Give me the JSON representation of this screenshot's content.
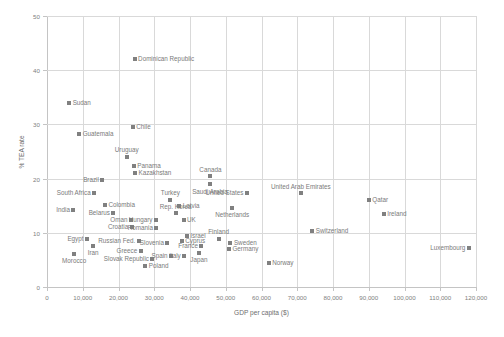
{
  "chart_data": {
    "type": "scatter",
    "title": "",
    "xlabel": "GDP per capita ($)",
    "ylabel": "% TEA rate",
    "xlim": [
      0,
      120000
    ],
    "ylim": [
      0,
      50
    ],
    "xticks": [
      "0",
      "10,000",
      "20,000",
      "30,000",
      "40,000",
      "50,000",
      "60,000",
      "70,000",
      "80,000",
      "90,000",
      "100,000",
      "110,000",
      "120,000"
    ],
    "xtick_values": [
      0,
      10000,
      20000,
      30000,
      40000,
      50000,
      60000,
      70000,
      80000,
      90000,
      100000,
      110000,
      120000
    ],
    "yticks": [
      "0",
      "10",
      "20",
      "30",
      "40",
      "50"
    ],
    "ytick_values": [
      0,
      10,
      20,
      30,
      40,
      50
    ],
    "grid": "vertical and horizontal",
    "legend": "none",
    "marker_color": "#808080",
    "marker_shape": "square",
    "points": [
      {
        "label": "Dominican Republic",
        "x": 24500,
        "y": 42.0,
        "pos": "right"
      },
      {
        "label": "Sudan",
        "x": 6200,
        "y": 34.0,
        "pos": "right"
      },
      {
        "label": "Chile",
        "x": 24000,
        "y": 29.6,
        "pos": "right"
      },
      {
        "label": "Guatemala",
        "x": 9000,
        "y": 28.3,
        "pos": "right"
      },
      {
        "label": "Uruguay",
        "x": 22300,
        "y": 24.0,
        "pos": "above"
      },
      {
        "label": "Panama",
        "x": 24300,
        "y": 22.3,
        "pos": "right"
      },
      {
        "label": "Kazakhstan",
        "x": 24600,
        "y": 21.0,
        "pos": "right"
      },
      {
        "label": "Canada",
        "x": 45700,
        "y": 20.4,
        "pos": "above"
      },
      {
        "label": "Saudi Arabia",
        "x": 45600,
        "y": 19.0,
        "pos": "below"
      },
      {
        "label": "Brazil",
        "x": 15500,
        "y": 19.8,
        "pos": "left"
      },
      {
        "label": "South Africa",
        "x": 13200,
        "y": 17.4,
        "pos": "left"
      },
      {
        "label": "United States",
        "x": 55900,
        "y": 17.4,
        "pos": "left"
      },
      {
        "label": "United Arab Emirates",
        "x": 71000,
        "y": 17.3,
        "pos": "above"
      },
      {
        "label": "Qatar",
        "x": 90000,
        "y": 16.0,
        "pos": "right"
      },
      {
        "label": "Turkey",
        "x": 34500,
        "y": 16.1,
        "pos": "above"
      },
      {
        "label": "Colombia",
        "x": 16200,
        "y": 15.1,
        "pos": "right"
      },
      {
        "label": "Latvia",
        "x": 37000,
        "y": 15.0,
        "pos": "right"
      },
      {
        "label": "India",
        "x": 7400,
        "y": 14.2,
        "pos": "left"
      },
      {
        "label": "Belarus",
        "x": 18600,
        "y": 13.6,
        "pos": "left"
      },
      {
        "label": "Rep. Korea",
        "x": 36000,
        "y": 13.6,
        "pos": "above"
      },
      {
        "label": "Netherlands",
        "x": 51800,
        "y": 14.6,
        "pos": "below"
      },
      {
        "label": "Ireland",
        "x": 94200,
        "y": 13.4,
        "pos": "right"
      },
      {
        "label": "Oman",
        "x": 23500,
        "y": 12.4,
        "pos": "left"
      },
      {
        "label": "Hungary",
        "x": 30500,
        "y": 12.3,
        "pos": "left"
      },
      {
        "label": "UK",
        "x": 38200,
        "y": 12.4,
        "pos": "right"
      },
      {
        "label": "Croatia",
        "x": 23700,
        "y": 11.1,
        "pos": "left"
      },
      {
        "label": "Romania",
        "x": 30600,
        "y": 10.8,
        "pos": "left"
      },
      {
        "label": "Switzerland",
        "x": 74200,
        "y": 10.3,
        "pos": "right"
      },
      {
        "label": "Luxembourg",
        "x": 118000,
        "y": 7.2,
        "pos": "left"
      },
      {
        "label": "Egypt",
        "x": 11200,
        "y": 8.9,
        "pos": "left"
      },
      {
        "label": "Israel",
        "x": 39100,
        "y": 9.4,
        "pos": "right"
      },
      {
        "label": "Cyprus",
        "x": 37700,
        "y": 8.5,
        "pos": "right"
      },
      {
        "label": "Finland",
        "x": 48000,
        "y": 8.9,
        "pos": "above"
      },
      {
        "label": "Sweden",
        "x": 51300,
        "y": 8.2,
        "pos": "right"
      },
      {
        "label": "Russian Fed.",
        "x": 25700,
        "y": 8.4,
        "pos": "left"
      },
      {
        "label": "Iran",
        "x": 12900,
        "y": 7.6,
        "pos": "below"
      },
      {
        "label": "Slovenia",
        "x": 33700,
        "y": 8.1,
        "pos": "left"
      },
      {
        "label": "France",
        "x": 43200,
        "y": 7.6,
        "pos": "left"
      },
      {
        "label": "Germany",
        "x": 50900,
        "y": 7.1,
        "pos": "right"
      },
      {
        "label": "Greece",
        "x": 26200,
        "y": 6.6,
        "pos": "left"
      },
      {
        "label": "Spain",
        "x": 34700,
        "y": 5.8,
        "pos": "left"
      },
      {
        "label": "Italy",
        "x": 38400,
        "y": 5.7,
        "pos": "left"
      },
      {
        "label": "Japan",
        "x": 42500,
        "y": 6.3,
        "pos": "below"
      },
      {
        "label": "Morocco",
        "x": 7600,
        "y": 6.1,
        "pos": "below"
      },
      {
        "label": "Slovak Republic",
        "x": 29500,
        "y": 5.1,
        "pos": "left"
      },
      {
        "label": "Poland",
        "x": 27500,
        "y": 3.9,
        "pos": "right"
      },
      {
        "label": "Norway",
        "x": 62000,
        "y": 4.4,
        "pos": "right"
      }
    ]
  }
}
